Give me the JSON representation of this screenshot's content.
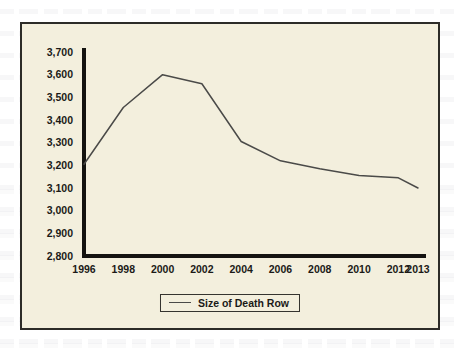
{
  "chart_data": {
    "type": "line",
    "title": "",
    "subtitle": "",
    "xlabel": "",
    "ylabel": "",
    "categories": [
      "1996",
      "1998",
      "2000",
      "2002",
      "2004",
      "2006",
      "2008",
      "2010",
      "2012",
      "2013"
    ],
    "x": [
      1996,
      1998,
      2000,
      2002,
      2004,
      2006,
      2008,
      2010,
      2012,
      2013
    ],
    "series": [
      {
        "name": "Size of Death Row",
        "values": [
          3205,
          3455,
          3600,
          3560,
          3305,
          3220,
          3185,
          3155,
          3145,
          3100
        ],
        "color": "#4a4a48"
      }
    ],
    "ylim": [
      2800,
      3700
    ],
    "ytick_step": 100,
    "ytick_labels": [
      "2,800",
      "2,900",
      "3,000",
      "3,100",
      "3,200",
      "3,300",
      "3,400",
      "3,500",
      "3,600",
      "3,700"
    ],
    "ytick_values": [
      2800,
      2900,
      3000,
      3100,
      3200,
      3300,
      3400,
      3500,
      3600,
      3700
    ],
    "xtick_labels": [
      "1996",
      "1998",
      "2000",
      "2002",
      "2004",
      "2006",
      "2008",
      "2010",
      "2012",
      "2013"
    ],
    "grid": false,
    "legend_position": "bottom-center",
    "axis_color": "#141310",
    "panel_background": "#f3efdd",
    "panel_border_color": "#2c2b27"
  },
  "legend": {
    "entries": [
      {
        "label": "Size of Death Row",
        "swatch": "line-swatch"
      }
    ]
  }
}
